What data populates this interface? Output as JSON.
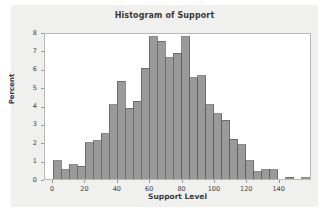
{
  "chart_data": {
    "type": "bar",
    "title": "Histogram of Support",
    "xlabel": "Support Level",
    "ylabel": "Percent",
    "grid": false,
    "legend": null,
    "xlim": [
      -5,
      160
    ],
    "ylim": [
      0,
      8
    ],
    "bin_width": 5,
    "xticks": [
      0,
      20,
      40,
      60,
      80,
      100,
      120,
      140
    ],
    "yticks": [
      0,
      1,
      2,
      3,
      4,
      5,
      6,
      7,
      8
    ],
    "bin_starts": [
      0,
      5,
      10,
      15,
      20,
      25,
      30,
      35,
      40,
      45,
      50,
      55,
      60,
      65,
      70,
      75,
      80,
      85,
      90,
      95,
      100,
      105,
      110,
      115,
      120,
      125,
      130,
      135,
      140,
      145,
      150,
      155
    ],
    "categories": [
      "0",
      "5",
      "10",
      "15",
      "20",
      "25",
      "30",
      "35",
      "40",
      "45",
      "50",
      "55",
      "60",
      "65",
      "70",
      "75",
      "80",
      "85",
      "90",
      "95",
      "100",
      "105",
      "110",
      "115",
      "120",
      "125",
      "130",
      "135",
      "140",
      "145",
      "150",
      "155"
    ],
    "values": [
      1.0,
      0.5,
      0.8,
      0.7,
      2.0,
      2.1,
      2.5,
      4.1,
      5.4,
      3.9,
      4.3,
      6.1,
      7.85,
      7.6,
      6.7,
      6.95,
      7.85,
      5.6,
      5.7,
      4.1,
      3.6,
      3.25,
      2.2,
      1.9,
      1.0,
      0.4,
      0.5,
      0.5,
      0.0,
      0.1,
      0.0,
      0.08
    ]
  },
  "style": {
    "bar_fill": "#9a9a9a",
    "bar_stroke": "#5a5a5a",
    "plot_background": "#ffffff",
    "canvas_background": "#f0f0ef",
    "frame_color": "#b9b9b9",
    "text_color": "#3a3a3a"
  }
}
